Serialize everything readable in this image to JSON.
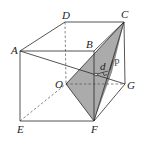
{
  "diagram": {
    "colors": {
      "line": "#2a2a2a",
      "shade_light": "#a8a8a8",
      "shade_dark": "#8c8c8c",
      "background": "#ffffff"
    },
    "vertices": {
      "A": {
        "label": "A",
        "x": 20,
        "y": 51
      },
      "B": {
        "label": "B",
        "x": 94,
        "y": 51
      },
      "C": {
        "label": "C",
        "x": 124,
        "y": 22
      },
      "D": {
        "label": "D",
        "x": 65,
        "y": 22
      },
      "E": {
        "label": "E",
        "x": 20,
        "y": 121
      },
      "F": {
        "label": "F",
        "x": 94,
        "y": 121
      },
      "G": {
        "label": "G",
        "x": 125,
        "y": 84
      },
      "O": {
        "label": "O",
        "x": 66,
        "y": 84
      }
    },
    "annotations": {
      "d_label": "d",
      "p_label": "P"
    },
    "solid_edges": [
      "A-D",
      "D-C",
      "A-B",
      "B-C",
      "A-E",
      "B-F",
      "C-G",
      "E-F",
      "F-G",
      "A-G"
    ],
    "dashed_edges": [
      "D-O",
      "O-G",
      "E-O"
    ],
    "shaded_face": [
      "O",
      "C",
      "F"
    ]
  }
}
